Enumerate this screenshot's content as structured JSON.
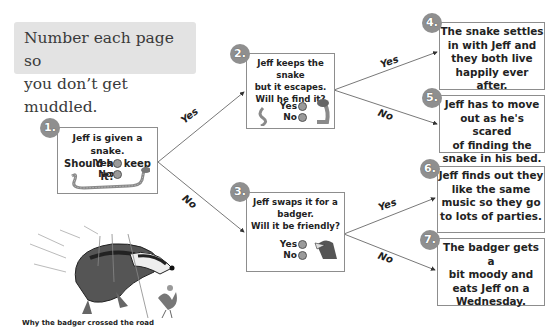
{
  "tip": {
    "line1": "Number each page so",
    "line2": "you don’t get muddled."
  },
  "nodes": [
    {
      "number": "1.",
      "question_lines": [
        "Jeff is given a snake.",
        "Should he keep it?"
      ],
      "options": [
        "Yes",
        "No"
      ],
      "illustration": "snake-icon"
    },
    {
      "number": "2.",
      "question_lines": [
        "Jeff keeps the snake",
        "but it escapes.",
        "Will he find it?"
      ],
      "options": [
        "Yes",
        "No"
      ],
      "illustration": "snake-icon"
    },
    {
      "number": "3.",
      "question_lines": [
        "Jeff swaps it for a",
        "badger.",
        "Will it be friendly?"
      ],
      "options": [
        "Yes",
        "No"
      ],
      "illustration": "badger-icon"
    }
  ],
  "outcomes": [
    {
      "number": "4.",
      "lines": [
        "The snake settles",
        "in with Jeff and",
        "they both live",
        "happily ever after."
      ]
    },
    {
      "number": "5.",
      "lines": [
        "Jeff has to move",
        "out as he's scared",
        "of finding the",
        "snake in his bed."
      ]
    },
    {
      "number": "6.",
      "lines": [
        "Jeff finds out they",
        "like the same",
        "music so they go",
        "to lots of parties."
      ]
    },
    {
      "number": "7.",
      "lines": [
        "The badger gets a",
        "bit moody and",
        "eats Jeff on a",
        "Wednesday."
      ]
    }
  ],
  "edges": [
    {
      "from": "1",
      "to": "2",
      "label": "Yes"
    },
    {
      "from": "1",
      "to": "3",
      "label": "No"
    },
    {
      "from": "2",
      "to": "4",
      "label": "Yes"
    },
    {
      "from": "2",
      "to": "5",
      "label": "No"
    },
    {
      "from": "3",
      "to": "6",
      "label": "Yes"
    },
    {
      "from": "3",
      "to": "7",
      "label": "No"
    }
  ],
  "illustration": {
    "caption": "Why the badger crossed the road"
  },
  "colors": {
    "badge": "#8f8f8f",
    "tip_background": "#e3e3e3",
    "border": "#8d8d8d"
  }
}
